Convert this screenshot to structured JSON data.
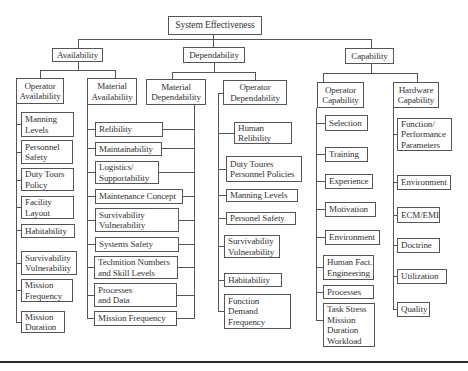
{
  "diagram": {
    "root": "System Effectiveness",
    "categories": [
      {
        "label": "Availability",
        "groups": [
          {
            "label": "Operator\nAvailability",
            "items": [
              "Manning\nLevels",
              "Personnel\nSafety",
              "Duty Tours\nPolicy",
              "Facility\nLayout",
              "Habitability",
              "Survivability\nVulnerability",
              "Mission\nFrequency",
              "Mission\nDuration"
            ]
          },
          {
            "label": "Material\nAvailability",
            "items": [
              "Relibility",
              "Maintainability",
              "Logistics/\nSupportability",
              "Maintenance Concept",
              "Survivability\nVulnerability",
              "Systems Safety",
              "Technition Numbers\nand Skill Levels",
              "Processes\nand Data",
              "Mission Frequency"
            ]
          }
        ]
      },
      {
        "label": "Dependability",
        "groups": [
          {
            "label": "Material\nDependability"
          },
          {
            "label": "Operator\nDependability",
            "items": [
              "Human\nRelibility",
              "Duty Toures\nPersonnel Policies",
              "Manning Levels",
              "Personel Safety",
              "Survivability\nVulnerability",
              "Habitability",
              "Function\nDemand\nFrequency"
            ]
          }
        ]
      },
      {
        "label": "Capability",
        "groups": [
          {
            "label": "Operator\nCapability",
            "items": [
              "Selection",
              "Training",
              "Experience",
              "Motivation",
              "Environment",
              "Human Fact.\nEngineering",
              "Processes",
              "Task Stress\nMission\nDuration\nWorkload"
            ]
          },
          {
            "label": "Hardware\nCapability",
            "items": [
              "Function/\nPerformance\nParameters",
              "Environment",
              "ECM/EMI",
              "Doctrine",
              "Utilization",
              "Quality"
            ]
          }
        ]
      }
    ]
  }
}
